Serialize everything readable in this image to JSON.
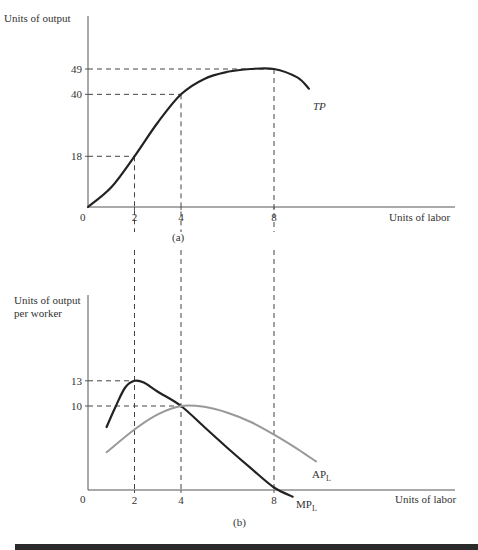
{
  "chart_data": [
    {
      "type": "line",
      "panel_label": "(a)",
      "ylabel": "Units of output",
      "xlabel": "Units of labor",
      "origin_label": "0",
      "xlim": [
        0,
        14.5
      ],
      "ylim": [
        0,
        60
      ],
      "x_ticks": [
        2,
        4,
        8
      ],
      "y_ticks": [
        18,
        40,
        49
      ],
      "grid": false,
      "series": [
        {
          "name": "TP",
          "color": "#222222",
          "x": [
            0,
            1,
            2,
            3,
            4,
            5,
            6,
            7,
            8,
            9,
            9.5
          ],
          "y": [
            0,
            7,
            18,
            30,
            40,
            45.5,
            48,
            49,
            49,
            46,
            42
          ]
        }
      ],
      "guides": [
        {
          "x": 2,
          "y": 18
        },
        {
          "x": 4,
          "y": 40
        },
        {
          "x": 8,
          "y": 49
        }
      ]
    },
    {
      "type": "line",
      "panel_label": "(b)",
      "ylabel": "Units of output\nper worker",
      "ylabel_lines": [
        "Units of output",
        "per worker"
      ],
      "xlabel": "Units of labor",
      "origin_label": "0",
      "xlim": [
        0,
        14.5
      ],
      "ylim": [
        0,
        18
      ],
      "x_ticks": [
        2,
        4,
        8
      ],
      "y_ticks": [
        10,
        13
      ],
      "grid": false,
      "series": [
        {
          "name": "MP_L",
          "label_main": "MP",
          "label_sub": "L",
          "color": "#222222",
          "x": [
            0.8,
            1.2,
            1.6,
            2,
            2.4,
            3,
            4,
            5,
            6,
            7,
            8,
            8.8
          ],
          "y": [
            7.5,
            10,
            12.2,
            13,
            12.8,
            11.7,
            10,
            7.5,
            5,
            2.6,
            0.3,
            -0.8
          ]
        },
        {
          "name": "AP_L",
          "label_main": "AP",
          "label_sub": "L",
          "color": "#999999",
          "x": [
            0.8,
            2,
            3,
            4,
            5,
            6,
            7,
            8,
            9,
            9.8
          ],
          "y": [
            4.5,
            7.2,
            9,
            10,
            9.9,
            9.2,
            8.1,
            6.6,
            4.9,
            3.4
          ]
        }
      ],
      "guides": [
        {
          "x": 2,
          "y": 13
        },
        {
          "x": 4,
          "y": 10
        },
        {
          "x": 8,
          "y": null
        }
      ]
    }
  ]
}
